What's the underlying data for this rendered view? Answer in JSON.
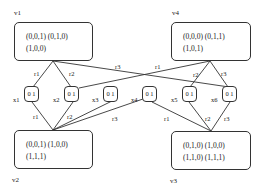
{
  "vertices": {
    "v1": {
      "label": "v1",
      "line1": "(0,0,1)  (0,1,0)",
      "line2": "(1,0,0)"
    },
    "v4": {
      "label": "v4",
      "line1": "(0,0,0)  (0,1,1)",
      "line2": "(1,0,1)"
    },
    "v2": {
      "label": "v2",
      "line1": "(0,0,1)  (1,0,0)",
      "line2": "(1,1,1)"
    },
    "v3": {
      "label": "v3",
      "line1": "(0,1,0)  (1,0,0)",
      "line2": "(1,1,0)  (1,1,1)"
    }
  },
  "xnodes": [
    {
      "label": "x1",
      "value": "0 1"
    },
    {
      "label": "x2",
      "value": "0 1"
    },
    {
      "label": "x3",
      "value": "0 1"
    },
    {
      "label": "x4",
      "value": "0 1"
    },
    {
      "label": "x5",
      "value": "0 1"
    },
    {
      "label": "x6",
      "value": "0 1"
    }
  ],
  "edges": [
    {
      "from": "v1",
      "to": "x1",
      "label": "r1"
    },
    {
      "from": "v1",
      "to": "x2",
      "label": "r2"
    },
    {
      "from": "v1",
      "to": "x6",
      "label": "r3"
    },
    {
      "from": "v4",
      "to": "x2",
      "label": "r1"
    },
    {
      "from": "v4",
      "to": "x5",
      "label": "r2"
    },
    {
      "from": "v4",
      "to": "x6",
      "label": "r3"
    },
    {
      "from": "x1",
      "to": "v2",
      "label": "r1"
    },
    {
      "from": "x2",
      "to": "v2",
      "label": "r2"
    },
    {
      "from": "x3",
      "to": "v2",
      "label": "r3"
    },
    {
      "from": "x4",
      "to": "v3",
      "label": "r1"
    },
    {
      "from": "x5",
      "to": "v3",
      "label": "r2"
    },
    {
      "from": "x6",
      "to": "v3",
      "label": "r3"
    }
  ]
}
